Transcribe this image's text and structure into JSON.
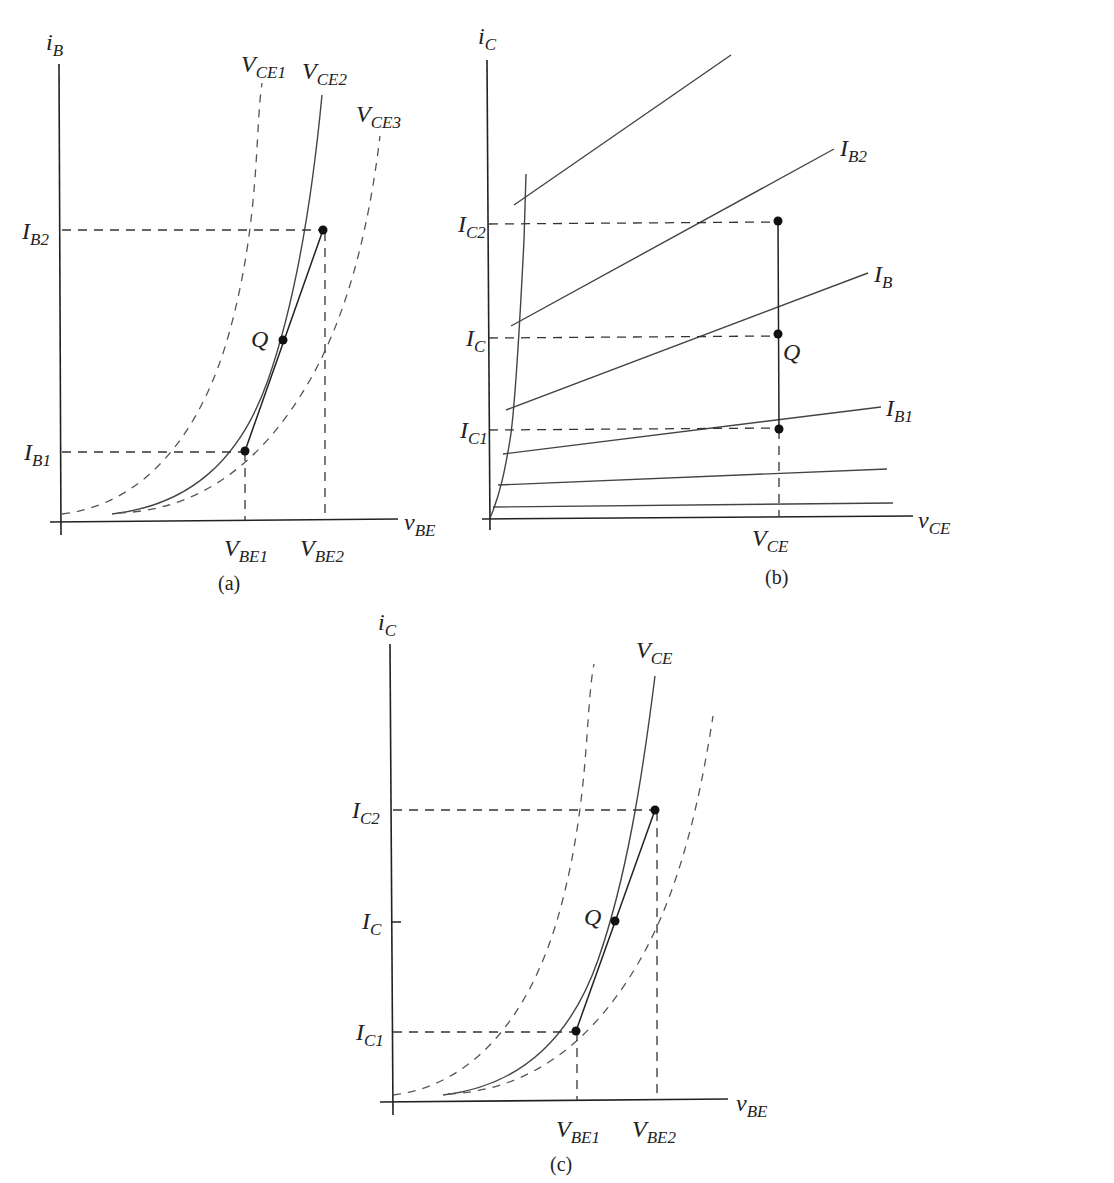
{
  "diagram_a": {
    "caption": "(a)",
    "y_axis": {
      "main": "i",
      "sub": "B"
    },
    "x_axis": {
      "main": "v",
      "sub": "BE"
    },
    "curve_labels": [
      {
        "main": "V",
        "sub": "CE1"
      },
      {
        "main": "V",
        "sub": "CE2"
      },
      {
        "main": "V",
        "sub": "CE3"
      }
    ],
    "y_ticks": [
      {
        "main": "I",
        "sub": "B2"
      },
      {
        "main": "I",
        "sub": "B1"
      }
    ],
    "x_ticks": [
      {
        "main": "V",
        "sub": "BE1"
      },
      {
        "main": "V",
        "sub": "BE2"
      }
    ],
    "point_label": "Q"
  },
  "diagram_b": {
    "caption": "(b)",
    "y_axis": {
      "main": "i",
      "sub": "C"
    },
    "x_axis": {
      "main": "v",
      "sub": "CE"
    },
    "curve_labels": [
      {
        "main": "I",
        "sub": "B2"
      },
      {
        "main": "I",
        "sub": "B"
      },
      {
        "main": "I",
        "sub": "B1"
      }
    ],
    "y_ticks": [
      {
        "main": "I",
        "sub": "C2"
      },
      {
        "main": "I",
        "sub": "C"
      },
      {
        "main": "I",
        "sub": "C1"
      }
    ],
    "x_ticks": [
      {
        "main": "V",
        "sub": "CE"
      }
    ],
    "point_label": "Q"
  },
  "diagram_c": {
    "caption": "(c)",
    "y_axis": {
      "main": "i",
      "sub": "C"
    },
    "x_axis": {
      "main": "v",
      "sub": "BE"
    },
    "curve_labels": [
      {
        "main": "V",
        "sub": "CE"
      }
    ],
    "y_ticks": [
      {
        "main": "I",
        "sub": "C2"
      },
      {
        "main": "I",
        "sub": "C"
      },
      {
        "main": "I",
        "sub": "C1"
      }
    ],
    "x_ticks": [
      {
        "main": "V",
        "sub": "BE1"
      },
      {
        "main": "V",
        "sub": "BE2"
      }
    ],
    "point_label": "Q"
  }
}
